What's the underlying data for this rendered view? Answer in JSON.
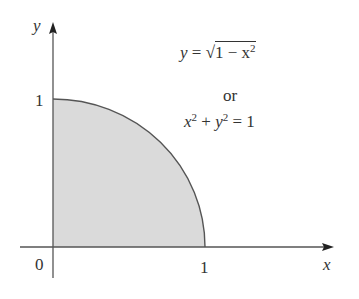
{
  "figure": {
    "axes": {
      "x_label": "x",
      "y_label": "y",
      "origin_label": "0",
      "x_tick": "1",
      "y_tick": "1"
    },
    "equations": {
      "line1_lhs": "y",
      "line1_eq": "=",
      "line1_sqrt_body": "1 − x",
      "line1_exp": "2",
      "line2": "or",
      "line3_a": "x",
      "line3_exp1": "2",
      "line3_plus": " + ",
      "line3_b": "y",
      "line3_exp2": "2",
      "line3_rhs": " = 1"
    },
    "region": {
      "description": "quarter disk in first quadrant",
      "fill_color": "#d9d9d9",
      "curve_color": "#555555"
    }
  }
}
